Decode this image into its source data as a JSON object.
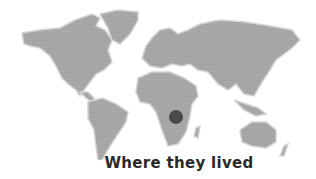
{
  "map": {
    "land_color": "#a9a9a9",
    "coast_color": "#cfcfcf",
    "marker": {
      "cx": 176,
      "cy": 117,
      "r": 7,
      "color": "#4a4a4a",
      "label": "location-marker"
    }
  },
  "caption": "Where they lived"
}
